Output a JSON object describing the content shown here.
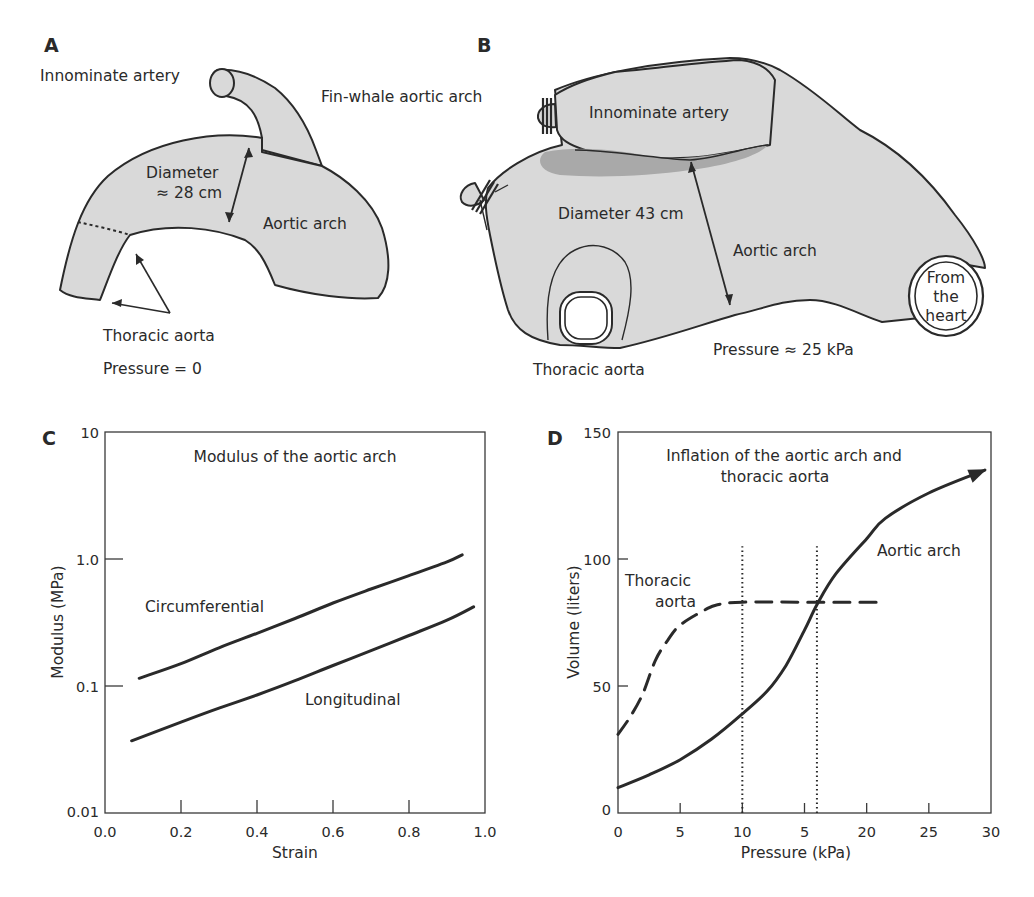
{
  "panels": {
    "A": {
      "letter": "A",
      "labels": {
        "innominate": "Innominate artery",
        "title": "Fin-whale aortic arch",
        "diameter_line1": "Diameter",
        "diameter_line2": "≈ 28 cm",
        "aortic_arch": "Aortic arch",
        "thoracic_aorta": "Thoracic aorta",
        "pressure": "Pressure = 0"
      }
    },
    "B": {
      "letter": "B",
      "labels": {
        "innominate": "Innominate artery",
        "diameter": "Diameter 43 cm",
        "aortic_arch": "Aortic arch",
        "from_heart_1": "From",
        "from_heart_2": "the",
        "from_heart_3": "heart",
        "thoracic_aorta": "Thoracic aorta",
        "pressure": "Pressure ≈ 25 kPa"
      }
    }
  },
  "chart_data": [
    {
      "panel": "C",
      "type": "line",
      "title": "Modulus of the aortic arch",
      "xlabel": "Strain",
      "ylabel": "Modulus (MPa)",
      "xlim": [
        0.0,
        1.0
      ],
      "ylim": [
        0.01,
        10
      ],
      "yscale": "log",
      "xticks": [
        "0.0",
        "0.2",
        "0.4",
        "0.6",
        "0.8",
        "1.0"
      ],
      "yticks": [
        "0.01",
        "0.1",
        "1.0",
        "10"
      ],
      "grid": false,
      "series": [
        {
          "name": "Circumferential",
          "style": "solid",
          "x": [
            0.09,
            0.2,
            0.3,
            0.4,
            0.5,
            0.6,
            0.7,
            0.8,
            0.9,
            0.94
          ],
          "y": [
            0.115,
            0.15,
            0.2,
            0.26,
            0.34,
            0.45,
            0.58,
            0.74,
            0.95,
            1.08
          ]
        },
        {
          "name": "Longitudinal",
          "style": "solid",
          "x": [
            0.07,
            0.2,
            0.3,
            0.4,
            0.5,
            0.6,
            0.7,
            0.8,
            0.9,
            0.97
          ],
          "y": [
            0.037,
            0.052,
            0.067,
            0.085,
            0.11,
            0.145,
            0.19,
            0.25,
            0.33,
            0.42
          ]
        }
      ]
    },
    {
      "panel": "D",
      "type": "line",
      "title": "Inflation of the aortic arch and thoracic aorta",
      "title_line1": "Inflation of the aortic arch and",
      "title_line2": "thoracic aorta",
      "xlabel": "Pressure (kPa)",
      "ylabel": "Volume (liters)",
      "xlim": [
        0,
        30
      ],
      "ylim": [
        0,
        150
      ],
      "xticks": [
        "0",
        "5",
        "10",
        "5",
        "20",
        "25",
        "30"
      ],
      "yticks": [
        "0",
        "50",
        "100",
        "150"
      ],
      "grid": false,
      "series": [
        {
          "name": "Aortic arch",
          "style": "solid",
          "arrow_end": true,
          "x": [
            0,
            2.5,
            5,
            7.5,
            10,
            12,
            13.5,
            15,
            16,
            17.5,
            20,
            21.5,
            25,
            29.5
          ],
          "y": [
            10,
            15,
            21,
            29,
            39,
            48,
            58,
            72,
            82,
            94,
            108,
            116,
            126,
            135
          ]
        },
        {
          "name": "Thoracic aorta",
          "label_line1": "Thoracic",
          "label_line2": "aorta",
          "style": "dashed",
          "x": [
            0,
            1,
            2,
            3,
            4,
            5,
            7,
            8,
            10,
            15,
            21.5
          ],
          "y": [
            31,
            38,
            47,
            60,
            68,
            74,
            80,
            82,
            83,
            83,
            83
          ]
        }
      ],
      "vlines": [
        {
          "x": 10,
          "y_top": 105,
          "style": "dotted"
        },
        {
          "x": 16,
          "y_top": 105,
          "style": "dotted"
        }
      ]
    }
  ]
}
